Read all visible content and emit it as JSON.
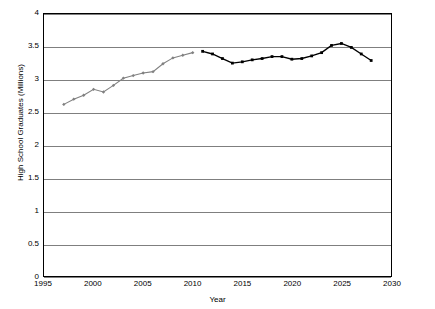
{
  "chart_data": {
    "type": "line",
    "title": "",
    "xlabel": "Year",
    "ylabel": "High School Graduates (Millions)",
    "xlim": [
      1995,
      2030
    ],
    "ylim": [
      0,
      4
    ],
    "xticks": [
      1995,
      2000,
      2005,
      2010,
      2015,
      2020,
      2025,
      2030
    ],
    "yticks": [
      0,
      0.5,
      1,
      1.5,
      2,
      2.5,
      3,
      3.5,
      4
    ],
    "grid": "horizontal",
    "legend": "none",
    "series": [
      {
        "name": "Actual",
        "color": "#808080",
        "marker": "diamond",
        "x": [
          1997,
          1998,
          1999,
          2000,
          2001,
          2002,
          2003,
          2004,
          2005,
          2006,
          2007,
          2008,
          2009,
          2010
        ],
        "values": [
          2.62,
          2.7,
          2.76,
          2.85,
          2.81,
          2.91,
          3.02,
          3.06,
          3.1,
          3.12,
          3.24,
          3.33,
          3.37,
          3.41
        ]
      },
      {
        "name": "Projected",
        "color": "#000000",
        "marker": "square",
        "x": [
          2011,
          2012,
          2013,
          2014,
          2015,
          2016,
          2017,
          2018,
          2019,
          2020,
          2021,
          2022,
          2023,
          2024,
          2025,
          2026,
          2027,
          2028
        ],
        "values": [
          3.43,
          3.39,
          3.32,
          3.25,
          3.27,
          3.3,
          3.32,
          3.35,
          3.35,
          3.31,
          3.32,
          3.36,
          3.41,
          3.52,
          3.55,
          3.49,
          3.39,
          3.29
        ]
      }
    ]
  }
}
